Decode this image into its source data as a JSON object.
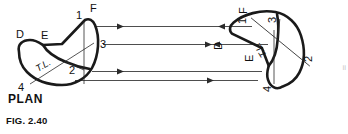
{
  "figure": {
    "caption_plan": "PLAN",
    "caption_fig": "FIG. 2.40",
    "edge_mark": "ii"
  },
  "left_shape": {
    "name": "plan-crescent-left",
    "labels": {
      "D": "D",
      "E": "E",
      "F": "F",
      "one": "1",
      "two": "2",
      "three": "3",
      "four": "4",
      "tl": "T.L."
    }
  },
  "right_shape": {
    "name": "plan-crescent-right-rotated",
    "labels": {
      "D": "D",
      "E": "E",
      "F": "F",
      "one": "1",
      "two": "2",
      "three": "3",
      "four": "4",
      "tl": "T.L."
    }
  },
  "projection_lines": {
    "count": 4,
    "direction": "right",
    "label": "projection-lines"
  },
  "colors": {
    "outline": "#1a1a1a",
    "thin": "#2b2b2b",
    "projection": "#3a3a3a",
    "text": "#111111",
    "background": "#ffffff"
  }
}
